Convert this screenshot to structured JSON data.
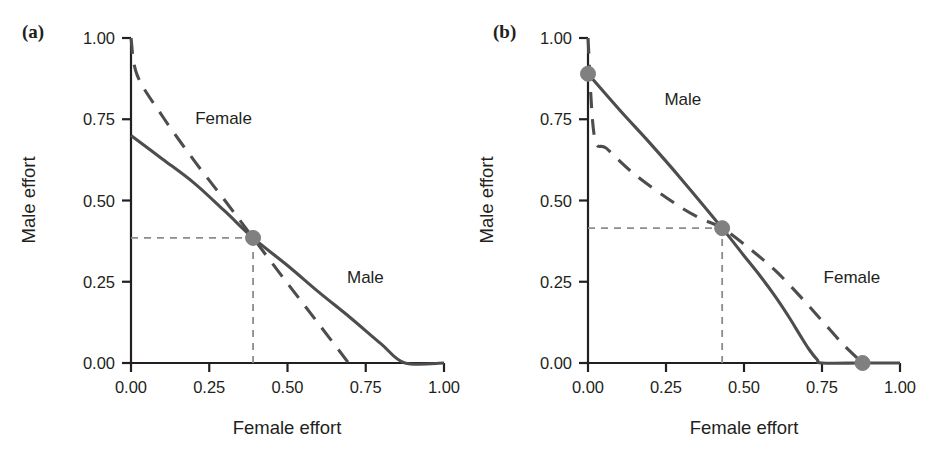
{
  "figure": {
    "background_color": "#ffffff",
    "line_color": "#4d4d4d",
    "axis_color": "#231f20",
    "marker_color": "#808080",
    "guide_color": "#8c8c8c"
  },
  "panels": [
    {
      "key": "a",
      "panel_label": "(a)",
      "xlabel": "Female effort",
      "ylabel": "Male effort",
      "xticks": [
        "0.00",
        "0.25",
        "0.50",
        "0.75",
        "1.00"
      ],
      "yticks": [
        "0.00",
        "0.25",
        "0.50",
        "0.75",
        "1.00"
      ],
      "series_labels": {
        "female": "Female",
        "male": "Male"
      }
    },
    {
      "key": "b",
      "panel_label": "(b)",
      "xlabel": "Female effort",
      "ylabel": "Male effort",
      "xticks": [
        "0.00",
        "0.25",
        "0.50",
        "0.75",
        "1.00"
      ],
      "yticks": [
        "0.00",
        "0.25",
        "0.50",
        "0.75",
        "1.00"
      ],
      "series_labels": {
        "female": "Female",
        "male": "Male"
      }
    }
  ],
  "chart_data": [
    {
      "type": "line",
      "panel": "(a)",
      "title": "",
      "xlabel": "Female effort",
      "ylabel": "Male effort",
      "xlim": [
        0.0,
        1.0
      ],
      "ylim": [
        0.0,
        1.0
      ],
      "xticks": [
        0.0,
        0.25,
        0.5,
        0.75,
        1.0
      ],
      "yticks": [
        0.0,
        0.25,
        0.5,
        0.75,
        1.0
      ],
      "grid": false,
      "legend": "inline-labels",
      "series": [
        {
          "name": "Male",
          "style": "solid",
          "label_position": {
            "x": 0.69,
            "y": 0.245
          },
          "x": [
            0.0,
            0.1,
            0.2,
            0.3,
            0.39,
            0.5,
            0.6,
            0.7,
            0.8,
            0.875,
            1.0
          ],
          "y": [
            0.7,
            0.628,
            0.555,
            0.467,
            0.385,
            0.3,
            0.218,
            0.14,
            0.058,
            0.0,
            0.0
          ]
        },
        {
          "name": "Female",
          "style": "dashed",
          "label_position": {
            "x": 0.205,
            "y": 0.735
          },
          "x": [
            0.0,
            0.02,
            0.1,
            0.2,
            0.3,
            0.39,
            0.5,
            0.6,
            0.695
          ],
          "y": [
            1.0,
            0.885,
            0.76,
            0.625,
            0.5,
            0.385,
            0.245,
            0.12,
            0.0
          ]
        }
      ],
      "markers": [
        {
          "name": "intersection",
          "x": 0.39,
          "y": 0.385
        }
      ],
      "guides": [
        {
          "type": "horizontal-dashed",
          "y": 0.385,
          "from_x": 0.0,
          "to_x": 0.39
        },
        {
          "type": "vertical-dashed",
          "x": 0.39,
          "from_y": 0.0,
          "to_y": 0.385
        }
      ],
      "annotations": [
        {
          "text": "Female",
          "x": 0.205,
          "y": 0.735
        },
        {
          "text": "Male",
          "x": 0.69,
          "y": 0.245
        }
      ]
    },
    {
      "type": "line",
      "panel": "(b)",
      "title": "",
      "xlabel": "Female effort",
      "ylabel": "Male effort",
      "xlim": [
        0.0,
        1.0
      ],
      "ylim": [
        0.0,
        1.0
      ],
      "xticks": [
        0.0,
        0.25,
        0.5,
        0.75,
        1.0
      ],
      "yticks": [
        0.0,
        0.25,
        0.5,
        0.75,
        1.0
      ],
      "grid": false,
      "legend": "inline-labels",
      "series": [
        {
          "name": "Male",
          "style": "solid",
          "label_position": {
            "x": 0.245,
            "y": 0.795
          },
          "x": [
            0.0,
            0.1,
            0.2,
            0.3,
            0.43,
            0.5,
            0.55,
            0.6,
            0.645,
            0.68,
            0.71,
            0.735,
            0.75,
            0.88,
            1.0
          ],
          "y": [
            0.89,
            0.78,
            0.675,
            0.565,
            0.415,
            0.33,
            0.27,
            0.205,
            0.14,
            0.085,
            0.04,
            0.01,
            0.0,
            0.0,
            0.0
          ]
        },
        {
          "name": "Female",
          "style": "dashed",
          "label_position": {
            "x": 0.755,
            "y": 0.245
          },
          "x": [
            0.0,
            0.02,
            0.06,
            0.15,
            0.28,
            0.36,
            0.43,
            0.52,
            0.6,
            0.68,
            0.75,
            0.82,
            0.88
          ],
          "y": [
            1.0,
            0.7,
            0.66,
            0.58,
            0.49,
            0.445,
            0.415,
            0.35,
            0.285,
            0.205,
            0.13,
            0.055,
            0.0
          ]
        }
      ],
      "markers": [
        {
          "name": "male-start",
          "x": 0.0,
          "y": 0.89
        },
        {
          "name": "intersection",
          "x": 0.43,
          "y": 0.415
        },
        {
          "name": "female-end",
          "x": 0.88,
          "y": 0.0
        }
      ],
      "guides": [
        {
          "type": "horizontal-dashed",
          "y": 0.415,
          "from_x": 0.0,
          "to_x": 0.43
        },
        {
          "type": "vertical-dashed",
          "x": 0.43,
          "from_y": 0.0,
          "to_y": 0.415
        }
      ],
      "annotations": [
        {
          "text": "Male",
          "x": 0.245,
          "y": 0.795
        },
        {
          "text": "Female",
          "x": 0.755,
          "y": 0.245
        }
      ]
    }
  ]
}
